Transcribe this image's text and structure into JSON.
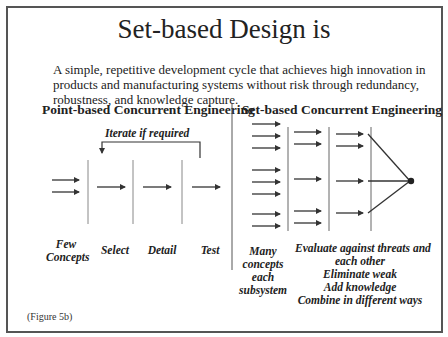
{
  "title": "Set-based Design is",
  "intro": {
    "lines": [
      "A simple, repetitive development cycle that achieves high innovation in",
      "products and manufacturing systems without risk through redundancy,",
      "robustness, and knowledge capture."
    ]
  },
  "point_based": {
    "heading": "Point-based Concurrent Engineering",
    "loop_label": "Iterate if required",
    "stages": [
      {
        "label_lines": [
          "Few",
          "Concepts"
        ]
      },
      {
        "label_lines": [
          "Select"
        ]
      },
      {
        "label_lines": [
          "Detail"
        ]
      },
      {
        "label_lines": [
          "Test"
        ]
      }
    ]
  },
  "set_based": {
    "heading": "Set-based Concurrent Engineering",
    "left_label_lines": [
      "Many",
      "concepts",
      "each",
      "subsystem"
    ],
    "right_label_lines": [
      "Evaluate against threats and",
      "each other",
      "Eliminate weak",
      "Add knowledge",
      "Combine in different ways"
    ]
  },
  "caption": "(Figure 5b)",
  "colors": {
    "line": "#333333",
    "divider": "#888888",
    "frame": "#555555"
  }
}
